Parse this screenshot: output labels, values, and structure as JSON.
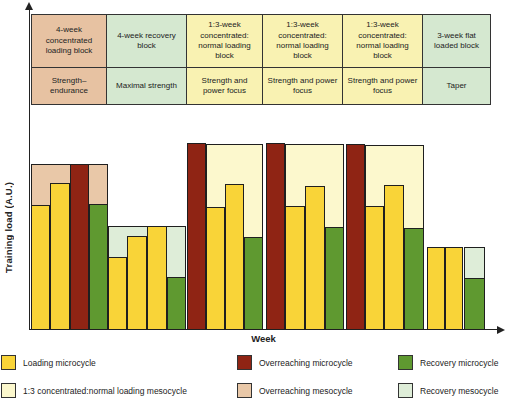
{
  "colors": {
    "loading_microcycle": "#F9D438",
    "overreaching_microcycle": "#8F2414",
    "recovery_microcycle": "#5F9930",
    "concentrated_mesocycle": "#FCF8CD",
    "overreaching_mesocycle": "#E9C8A8",
    "recovery_mesocycle": "#DEEDD8",
    "table_tan": "#E7C2A2",
    "table_green": "#D5E8D0",
    "table_yellow": "#F9F2B2",
    "axis": "#222222"
  },
  "table": {
    "columns": [
      {
        "block": "4-week concentrated loading block",
        "focus": "Strength–endurance",
        "color": "table_tan"
      },
      {
        "block": "4-week recovery block",
        "focus": "Maximal strength",
        "color": "table_green"
      },
      {
        "block": "1:3-week concentrated: normal loading block",
        "focus": "Strength and power focus",
        "color": "table_yellow"
      },
      {
        "block": "1:3-week concentrated: normal loading block",
        "focus": "Strength and power focus",
        "color": "table_yellow"
      },
      {
        "block": "1:3-week concentrated: normal loading block",
        "focus": "Strength and power focus",
        "color": "table_yellow"
      },
      {
        "block": "3-week flat loaded block",
        "focus": "Taper",
        "color": "table_green"
      }
    ]
  },
  "chart_data": {
    "type": "bar",
    "xlabel": "Week",
    "ylabel": "Training load (A.U.)",
    "y_unit": "arbitrary units (A.U.)",
    "n_weeks": 23,
    "x_tick_labels_shown": false,
    "legend_position": "bottom",
    "type_colors": {
      "loading": "loading_microcycle",
      "overreaching": "overreaching_microcycle",
      "recovery": "recovery_microcycle"
    },
    "bars": [
      {
        "week": 1,
        "type": "loading",
        "load_au": 125,
        "x": 31,
        "w": 19
      },
      {
        "week": 2,
        "type": "loading",
        "load_au": 147,
        "x": 50,
        "w": 20
      },
      {
        "week": 3,
        "type": "overreaching",
        "load_au": 166,
        "x": 70,
        "w": 19
      },
      {
        "week": 4,
        "type": "recovery",
        "load_au": 126,
        "x": 89,
        "w": 19
      },
      {
        "week": 5,
        "type": "loading",
        "load_au": 73,
        "x": 108,
        "w": 19
      },
      {
        "week": 6,
        "type": "loading",
        "load_au": 94,
        "x": 127,
        "w": 20
      },
      {
        "week": 7,
        "type": "loading",
        "load_au": 104,
        "x": 147,
        "w": 20
      },
      {
        "week": 8,
        "type": "recovery",
        "load_au": 53,
        "x": 167,
        "w": 19
      },
      {
        "week": 9,
        "type": "overreaching",
        "load_au": 187,
        "x": 187,
        "w": 19
      },
      {
        "week": 10,
        "type": "loading",
        "load_au": 123,
        "x": 206,
        "w": 19
      },
      {
        "week": 11,
        "type": "loading",
        "load_au": 146,
        "x": 225,
        "w": 19
      },
      {
        "week": 12,
        "type": "recovery",
        "load_au": 93,
        "x": 244,
        "w": 19
      },
      {
        "week": 13,
        "type": "overreaching",
        "load_au": 187,
        "x": 266,
        "w": 19
      },
      {
        "week": 14,
        "type": "loading",
        "load_au": 124,
        "x": 285,
        "w": 20
      },
      {
        "week": 15,
        "type": "loading",
        "load_au": 144,
        "x": 305,
        "w": 20
      },
      {
        "week": 16,
        "type": "recovery",
        "load_au": 103,
        "x": 325,
        "w": 19
      },
      {
        "week": 17,
        "type": "overreaching",
        "load_au": 186,
        "x": 346,
        "w": 19
      },
      {
        "week": 18,
        "type": "loading",
        "load_au": 124,
        "x": 365,
        "w": 19
      },
      {
        "week": 19,
        "type": "loading",
        "load_au": 145,
        "x": 384,
        "w": 20
      },
      {
        "week": 20,
        "type": "recovery",
        "load_au": 102,
        "x": 404,
        "w": 20
      },
      {
        "week": 21,
        "type": "loading",
        "load_au": 83,
        "x": 427,
        "w": 18
      },
      {
        "week": 22,
        "type": "loading",
        "load_au": 83,
        "x": 445,
        "w": 18
      },
      {
        "week": 23,
        "type": "recovery",
        "load_au": 52,
        "x": 464,
        "w": 21
      }
    ],
    "bands": [
      {
        "block": "overreaching-mesocycle",
        "color": "overreaching_mesocycle",
        "x": 31,
        "w": 77,
        "h": 166
      },
      {
        "block": "recovery-mesocycle",
        "color": "recovery_mesocycle",
        "x": 108,
        "w": 78,
        "h": 104
      },
      {
        "block": "concentrated-normal-loading-1",
        "color": "concentrated_mesocycle",
        "x": 206,
        "w": 57,
        "h": 186
      },
      {
        "block": "concentrated-normal-loading-2",
        "color": "concentrated_mesocycle",
        "x": 285,
        "w": 59,
        "h": 186
      },
      {
        "block": "concentrated-normal-loading-3",
        "color": "concentrated_mesocycle",
        "x": 365,
        "w": 59,
        "h": 185
      },
      {
        "block": "taper-recovery-mesocycle",
        "color": "recovery_mesocycle",
        "x": 464,
        "w": 21,
        "h": 83
      }
    ]
  },
  "legend": {
    "items": [
      {
        "label": "Loading microcycle",
        "color": "loading_microcycle"
      },
      {
        "label": "Overreaching microcycle",
        "color": "overreaching_microcycle"
      },
      {
        "label": "Recovery microcycle",
        "color": "recovery_microcycle"
      },
      {
        "label": "1:3 concentrated:normal loading mesocycle",
        "color": "concentrated_mesocycle"
      },
      {
        "label": "Overreaching mesocycle",
        "color": "overreaching_mesocycle"
      },
      {
        "label": "Recovery mesocycle",
        "color": "recovery_mesocycle"
      }
    ]
  }
}
